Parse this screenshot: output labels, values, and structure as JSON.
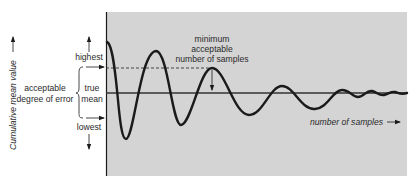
{
  "diagram": {
    "colors": {
      "panel_bg": "#d4d4d4",
      "ink": "#1a1a1a",
      "text": "#2a2a2a"
    },
    "y_axis_label": "Cumulative mean value",
    "x_axis_label": "number of samples",
    "labels": {
      "highest": "highest",
      "lowest": "lowest",
      "true_line1": "true",
      "true_line2": "mean",
      "error_line1": "acceptable",
      "error_line2": "degree of error"
    },
    "annotation": {
      "line1": "minimum",
      "line2": "acceptable",
      "line3": "number of samples"
    }
  }
}
